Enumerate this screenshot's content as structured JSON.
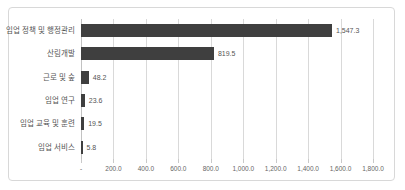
{
  "chart_data": {
    "type": "bar",
    "orientation": "horizontal",
    "title": "",
    "xlabel": "",
    "ylabel": "",
    "categories": [
      "임업 정책 및 행정관리",
      "산림개발",
      "근로 및 숲",
      "임업 연구",
      "임업 교육 및 훈련",
      "임업 서비스"
    ],
    "values": [
      1547.3,
      819.5,
      48.2,
      23.6,
      19.5,
      5.8
    ],
    "value_labels": [
      "1,547.3",
      "819.5",
      "48.2",
      "23.6",
      "19.5",
      "5.8"
    ],
    "xlim": [
      0,
      1800
    ],
    "xticks": [
      0,
      200,
      400,
      600,
      800,
      1000,
      1200,
      1400,
      1600,
      1800
    ],
    "xtick_labels": [
      "-",
      "200.0",
      "400.0",
      "600.0",
      "800.0",
      "1,000.0",
      "1,200.0",
      "1,400.0",
      "1,600.0",
      "1,800.0"
    ],
    "grid": true,
    "legend": false,
    "colors": {
      "bar": "#3f3f3f",
      "gridline": "#d9d9d9",
      "axis": "#c2c2c2",
      "label_text": "#555555",
      "tick_text": "#666666",
      "border": "#d8d8d8",
      "background": "#ffffff"
    }
  }
}
